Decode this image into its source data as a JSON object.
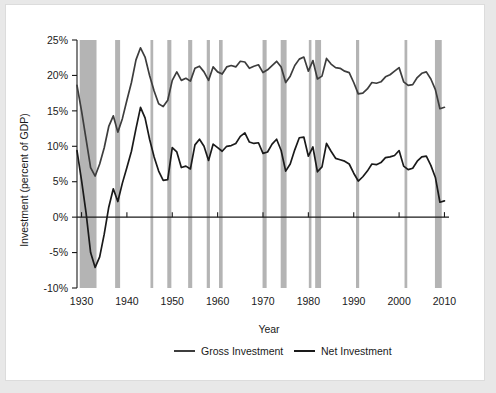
{
  "chart_data": {
    "type": "line",
    "title": "",
    "xlabel": "Year",
    "ylabel": "Investment (percent of GDP)",
    "xlim": [
      1929,
      2011
    ],
    "ylim": [
      -10,
      25
    ],
    "ytick_labels": [
      "25%",
      "20%",
      "15%",
      "10%",
      "5%",
      "0%",
      "-5%",
      "-10%"
    ],
    "ytick_values": [
      25,
      20,
      15,
      10,
      5,
      0,
      -5,
      -10
    ],
    "xtick_labels": [
      "1930",
      "1940",
      "1950",
      "1960",
      "1970",
      "1980",
      "1990",
      "2000",
      "2010"
    ],
    "xtick_values": [
      1930,
      1940,
      1950,
      1960,
      1970,
      1980,
      1990,
      2000,
      2010
    ],
    "grid": false,
    "legend_position": "bottom",
    "colors": {
      "gross": "#3d3d3d",
      "net": "#1a1a1a",
      "recession_band": "#b4b4b4",
      "axis": "#1a1a1a",
      "page_background": "#ffffff",
      "outer_background": "#e8e8e8"
    },
    "series": [
      {
        "name": "Gross Investment",
        "x": [
          1929,
          1930,
          1931,
          1932,
          1933,
          1934,
          1935,
          1936,
          1937,
          1938,
          1939,
          1940,
          1941,
          1942,
          1943,
          1944,
          1945,
          1946,
          1947,
          1948,
          1949,
          1950,
          1951,
          1952,
          1953,
          1954,
          1955,
          1956,
          1957,
          1958,
          1959,
          1960,
          1961,
          1962,
          1963,
          1964,
          1965,
          1966,
          1967,
          1968,
          1969,
          1970,
          1971,
          1972,
          1973,
          1974,
          1975,
          1976,
          1977,
          1978,
          1979,
          1980,
          1981,
          1982,
          1983,
          1984,
          1985,
          1986,
          1987,
          1988,
          1989,
          1990,
          1991,
          1992,
          1993,
          1994,
          1995,
          1996,
          1997,
          1998,
          1999,
          2000,
          2001,
          2002,
          2003,
          2004,
          2005,
          2006,
          2007,
          2008,
          2009,
          2010
        ],
        "values": [
          18.6,
          15.0,
          11.0,
          7.0,
          5.8,
          7.5,
          9.8,
          12.8,
          14.3,
          12.0,
          13.9,
          16.5,
          19.0,
          22.2,
          23.9,
          22.6,
          20.0,
          17.8,
          16.0,
          15.6,
          16.5,
          19.3,
          20.5,
          19.3,
          19.6,
          19.2,
          21.0,
          21.3,
          20.5,
          19.3,
          21.2,
          20.5,
          20.2,
          21.2,
          21.4,
          21.2,
          22.0,
          21.9,
          21.0,
          21.3,
          21.5,
          20.4,
          20.8,
          21.4,
          22.0,
          21.2,
          19.0,
          19.9,
          21.4,
          22.3,
          22.6,
          20.6,
          22.1,
          19.5,
          19.9,
          22.4,
          21.6,
          21.1,
          21.0,
          20.6,
          20.4,
          19.0,
          17.4,
          17.5,
          18.1,
          19.0,
          18.9,
          19.1,
          19.8,
          20.1,
          20.6,
          21.1,
          19.1,
          18.6,
          18.7,
          19.7,
          20.3,
          20.5,
          19.5,
          18.0,
          15.3,
          15.5
        ]
      },
      {
        "name": "Net Investment",
        "x": [
          1929,
          1930,
          1931,
          1932,
          1933,
          1934,
          1935,
          1936,
          1937,
          1938,
          1939,
          1940,
          1941,
          1942,
          1943,
          1944,
          1945,
          1946,
          1947,
          1948,
          1949,
          1950,
          1951,
          1952,
          1953,
          1954,
          1955,
          1956,
          1957,
          1958,
          1959,
          1960,
          1961,
          1962,
          1963,
          1964,
          1965,
          1966,
          1967,
          1968,
          1969,
          1970,
          1971,
          1972,
          1973,
          1974,
          1975,
          1976,
          1977,
          1978,
          1979,
          1980,
          1981,
          1982,
          1983,
          1984,
          1985,
          1986,
          1987,
          1988,
          1989,
          1990,
          1991,
          1992,
          1993,
          1994,
          1995,
          1996,
          1997,
          1998,
          1999,
          2000,
          2001,
          2002,
          2003,
          2004,
          2005,
          2006,
          2007,
          2008,
          2009,
          2010
        ],
        "values": [
          9.4,
          5.2,
          0.6,
          -5.0,
          -7.1,
          -5.6,
          -2.4,
          1.4,
          4.0,
          2.2,
          4.8,
          7.0,
          9.3,
          12.5,
          15.5,
          14.0,
          11.0,
          8.5,
          6.5,
          5.2,
          5.3,
          9.8,
          9.2,
          7.0,
          7.2,
          6.8,
          10.2,
          11.0,
          10.0,
          8.0,
          10.3,
          9.8,
          9.3,
          10.0,
          10.1,
          10.4,
          11.4,
          11.9,
          10.6,
          10.4,
          10.5,
          9.0,
          9.2,
          10.3,
          11.0,
          9.4,
          6.5,
          7.5,
          9.5,
          11.2,
          11.3,
          8.6,
          9.9,
          6.4,
          7.1,
          10.4,
          9.3,
          8.3,
          8.1,
          7.9,
          7.5,
          6.2,
          5.1,
          5.7,
          6.5,
          7.5,
          7.4,
          7.7,
          8.4,
          8.5,
          8.7,
          9.4,
          7.2,
          6.7,
          6.9,
          7.9,
          8.5,
          8.6,
          7.3,
          5.6,
          2.1,
          2.3
        ]
      }
    ],
    "recession_bands": [
      {
        "start": 1929.6,
        "end": 1933.3
      },
      {
        "start": 1937.4,
        "end": 1938.5
      },
      {
        "start": 1945.2,
        "end": 1945.8
      },
      {
        "start": 1948.9,
        "end": 1949.8
      },
      {
        "start": 1953.5,
        "end": 1954.4
      },
      {
        "start": 1957.6,
        "end": 1958.3
      },
      {
        "start": 1960.3,
        "end": 1961.1
      },
      {
        "start": 1969.9,
        "end": 1970.8
      },
      {
        "start": 1973.9,
        "end": 1975.2
      },
      {
        "start": 1980.1,
        "end": 1980.5
      },
      {
        "start": 1981.5,
        "end": 1982.8
      },
      {
        "start": 1990.5,
        "end": 1991.2
      },
      {
        "start": 2001.2,
        "end": 2001.8
      },
      {
        "start": 2007.9,
        "end": 2009.4
      }
    ]
  },
  "legend": {
    "items": [
      {
        "label": "Gross Investment"
      },
      {
        "label": "Net Investment"
      }
    ]
  }
}
